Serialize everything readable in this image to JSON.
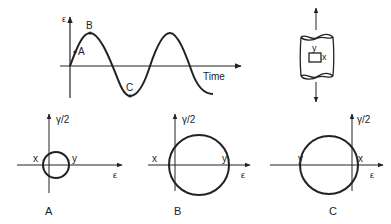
{
  "time_plot": {
    "y_label": "ε",
    "x_label": "Time",
    "points": [
      {
        "name": "A",
        "label": "A"
      },
      {
        "name": "B",
        "label": "B"
      },
      {
        "name": "C",
        "label": "C"
      }
    ]
  },
  "element": {
    "label_y": "y",
    "label_x": "x"
  },
  "mohr_circles": [
    {
      "panel": "A",
      "y_axis": "γ/2",
      "x_axis": "ε",
      "left_label": "x",
      "right_label": "y",
      "caption": "A"
    },
    {
      "panel": "B",
      "y_axis": "γ/2",
      "x_axis": "ε",
      "left_label": "x",
      "right_label": "y",
      "caption": "B"
    },
    {
      "panel": "C",
      "y_axis": "γ/2",
      "x_axis": "ε",
      "left_label": "y",
      "right_label": "x",
      "caption": "C"
    }
  ],
  "colors": {
    "ink": "#222222",
    "background": "#ffffff"
  }
}
